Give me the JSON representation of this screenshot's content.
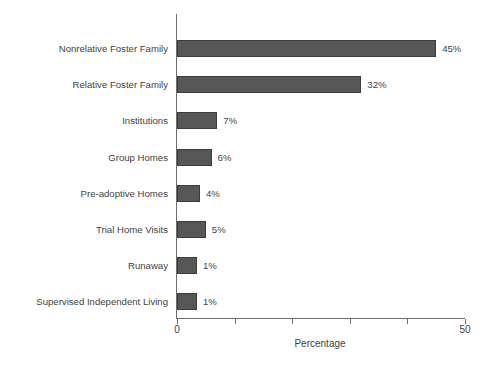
{
  "chart_data": {
    "type": "bar",
    "orientation": "horizontal",
    "title": "",
    "xlabel": "Percentage",
    "ylabel": "",
    "xlim": [
      0,
      50
    ],
    "grid": false,
    "legend": null,
    "categories": [
      "Nonrelative Foster Family",
      "Relative Foster Family",
      "Institutions",
      "Group Homes",
      "Pre-adoptive Homes",
      "Trial Home Visits",
      "Runaway",
      "Supervised Independent Living"
    ],
    "values": [
      45,
      32,
      7,
      6,
      4,
      5,
      1,
      1
    ],
    "value_labels": [
      "45%",
      "32%",
      "7%",
      "6%",
      "4%",
      "5%",
      "1%",
      "1%"
    ],
    "x_ticks": [
      0,
      10,
      20,
      30,
      40,
      50
    ],
    "x_tick_labels": [
      "0",
      "",
      "",
      "",
      "",
      "50"
    ],
    "bar_color": "#575757",
    "bar_border_color": "#3d3d3d",
    "axis_color": "#6e6e6e",
    "text_color": "#3f3f3f",
    "background_color": "#ffffff"
  }
}
